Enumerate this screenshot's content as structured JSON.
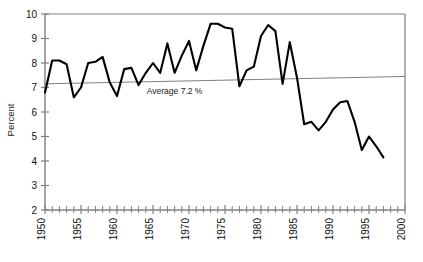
{
  "chart_data": {
    "type": "line",
    "title": "",
    "xlabel": "",
    "ylabel": "Percent",
    "xlim": [
      1950,
      2000
    ],
    "ylim": [
      2,
      10
    ],
    "grid": false,
    "legend": null,
    "axis": {
      "y_ticks": [
        2,
        3,
        4,
        5,
        6,
        7,
        8,
        9,
        10
      ],
      "y_tick_labels": [
        "2",
        "3",
        "4",
        "5",
        "6",
        "7",
        "8",
        "9",
        "10"
      ],
      "x_ticks": [
        1950,
        1955,
        1960,
        1965,
        1970,
        1975,
        1980,
        1985,
        1990,
        1995,
        2000
      ],
      "x_tick_labels": [
        "1950",
        "1955",
        "1960",
        "1965",
        "1970",
        "1975",
        "1980",
        "1985",
        "1990",
        "1995",
        "2000"
      ],
      "x_minor_tick_step": 1,
      "x_tick_label_rotation": -90
    },
    "series": [
      {
        "name": "Percent",
        "color": "#000000",
        "line_width": 2.1,
        "x": [
          1950,
          1951,
          1952,
          1953,
          1954,
          1955,
          1956,
          1957,
          1958,
          1959,
          1960,
          1961,
          1962,
          1963,
          1964,
          1965,
          1966,
          1967,
          1968,
          1969,
          1970,
          1971,
          1972,
          1973,
          1974,
          1975,
          1976,
          1977,
          1978,
          1979,
          1980,
          1981,
          1982,
          1983,
          1984,
          1985,
          1986,
          1987,
          1988,
          1989,
          1990,
          1991,
          1992,
          1993,
          1994,
          1995,
          1996,
          1997
        ],
        "values": [
          6.8,
          8.1,
          8.1,
          7.95,
          6.6,
          7.0,
          8.0,
          8.05,
          8.25,
          7.2,
          6.65,
          7.75,
          7.8,
          7.1,
          7.6,
          8.0,
          7.6,
          8.8,
          7.6,
          8.3,
          8.9,
          7.7,
          8.7,
          9.6,
          9.6,
          9.45,
          9.4,
          7.05,
          7.7,
          7.85,
          9.1,
          9.55,
          9.3,
          7.15,
          8.85,
          7.4,
          5.5,
          5.6,
          5.25,
          5.6,
          6.1,
          6.4,
          6.45,
          5.6,
          4.45,
          5.0,
          4.6,
          4.15
        ]
      }
    ],
    "reference_line": {
      "name": "average-trend-line",
      "label": "Average 7.2 %",
      "value": 7.2,
      "color": "#808080",
      "line_width": 1,
      "start_value": 7.15,
      "end_value": 7.45,
      "label_x": 1968,
      "label_y": 6.75
    },
    "frame": {
      "color": "#808080",
      "axis_color": "#808080",
      "top": true,
      "left": true,
      "right": true,
      "bottom": true
    }
  }
}
